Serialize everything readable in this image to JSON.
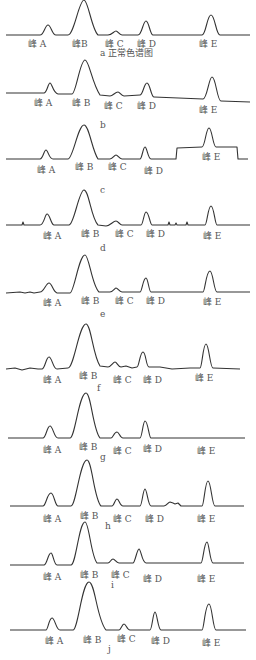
{
  "figure": {
    "panels": [
      {
        "id": "a",
        "caption": "a 正常色谱图",
        "baseline_y": 36,
        "caption_x": 100,
        "caption_y": 48,
        "labels": [
          {
            "t": "峰 A",
            "x": 28,
            "y": 39
          },
          {
            "t": "峰B",
            "x": 72,
            "y": 39
          },
          {
            "t": "峰 C",
            "x": 105,
            "y": 39
          },
          {
            "t": "峰 D",
            "x": 137,
            "y": 39
          },
          {
            "t": "峰 E",
            "x": 199,
            "y": 39
          }
        ]
      },
      {
        "id": "b",
        "caption": "b",
        "baseline_y": 94,
        "caption_x": 100,
        "caption_y": 120,
        "labels": [
          {
            "t": "峰 A",
            "x": 34,
            "y": 98
          },
          {
            "t": "峰 B",
            "x": 72,
            "y": 98
          },
          {
            "t": "峰 C",
            "x": 104,
            "y": 101
          },
          {
            "t": "峰 D",
            "x": 137,
            "y": 101
          },
          {
            "t": "峰 E",
            "x": 199,
            "y": 105
          }
        ]
      },
      {
        "id": "c",
        "caption": "c",
        "baseline_y": 159,
        "caption_x": 100,
        "caption_y": 185,
        "labels": [
          {
            "t": "峰 A",
            "x": 37,
            "y": 165
          },
          {
            "t": "峰 B",
            "x": 75,
            "y": 162
          },
          {
            "t": "峰 C",
            "x": 108,
            "y": 162
          },
          {
            "t": "峰 D",
            "x": 144,
            "y": 166
          },
          {
            "t": "峰 E",
            "x": 202,
            "y": 152
          }
        ]
      },
      {
        "id": "d",
        "caption": "d",
        "baseline_y": 225,
        "caption_x": 100,
        "caption_y": 243,
        "labels": [
          {
            "t": "峰 A",
            "x": 43,
            "y": 231
          },
          {
            "t": "峰 B",
            "x": 81,
            "y": 229
          },
          {
            "t": "峰 C",
            "x": 115,
            "y": 229
          },
          {
            "t": "峰 D",
            "x": 146,
            "y": 229
          },
          {
            "t": "峰 E",
            "x": 203,
            "y": 231
          }
        ]
      },
      {
        "id": "e",
        "caption": "e",
        "baseline_y": 292,
        "caption_x": 100,
        "caption_y": 309,
        "labels": [
          {
            "t": "峰 A",
            "x": 43,
            "y": 298
          },
          {
            "t": "峰 B",
            "x": 81,
            "y": 296
          },
          {
            "t": "峰 C",
            "x": 115,
            "y": 296
          },
          {
            "t": "峰 D",
            "x": 146,
            "y": 296
          },
          {
            "t": "峰 E",
            "x": 203,
            "y": 297
          }
        ]
      },
      {
        "id": "f",
        "caption": "f",
        "baseline_y": 368,
        "caption_x": 97,
        "caption_y": 383,
        "labels": [
          {
            "t": "峰 A",
            "x": 43,
            "y": 375
          },
          {
            "t": "峰 B",
            "x": 79,
            "y": 371
          },
          {
            "t": "峰 C",
            "x": 113,
            "y": 375
          },
          {
            "t": "峰 D",
            "x": 143,
            "y": 375
          },
          {
            "t": "峰 E",
            "x": 195,
            "y": 373
          }
        ]
      },
      {
        "id": "g",
        "caption": "g",
        "baseline_y": 438,
        "caption_x": 100,
        "caption_y": 452,
        "labels": [
          {
            "t": "峰 A",
            "x": 43,
            "y": 445
          },
          {
            "t": "峰 B",
            "x": 79,
            "y": 442
          },
          {
            "t": "峰 C",
            "x": 113,
            "y": 446
          },
          {
            "t": "峰 D",
            "x": 143,
            "y": 444
          },
          {
            "t": "峰 E",
            "x": 197,
            "y": 446
          }
        ]
      },
      {
        "id": "h",
        "caption": "h",
        "baseline_y": 506,
        "caption_x": 105,
        "caption_y": 521,
        "labels": [
          {
            "t": "峰 A",
            "x": 43,
            "y": 514
          },
          {
            "t": "峰 B",
            "x": 80,
            "y": 511
          },
          {
            "t": "峰 C",
            "x": 113,
            "y": 514
          },
          {
            "t": "峰 D",
            "x": 145,
            "y": 514
          },
          {
            "t": "峰 E",
            "x": 197,
            "y": 514
          }
        ]
      },
      {
        "id": "i",
        "caption": "i",
        "baseline_y": 565,
        "caption_x": 111,
        "caption_y": 580,
        "labels": [
          {
            "t": "峰 A",
            "x": 43,
            "y": 572
          },
          {
            "t": "峰 B",
            "x": 80,
            "y": 570
          },
          {
            "t": "峰 C",
            "x": 111,
            "y": 570
          },
          {
            "t": "峰 D",
            "x": 143,
            "y": 574
          },
          {
            "t": "峰 E",
            "x": 197,
            "y": 574
          }
        ]
      },
      {
        "id": "j",
        "caption": "j",
        "baseline_y": 631,
        "caption_x": 108,
        "caption_y": 644,
        "labels": [
          {
            "t": "峰 A",
            "x": 45,
            "y": 636
          },
          {
            "t": "峰 B",
            "x": 83,
            "y": 635
          },
          {
            "t": "峰 C",
            "x": 117,
            "y": 634
          },
          {
            "t": "峰 D",
            "x": 151,
            "y": 636
          },
          {
            "t": "峰 E",
            "x": 202,
            "y": 638
          }
        ]
      }
    ],
    "peak_names": [
      "峰 A",
      "峰 B",
      "峰 C",
      "峰 D",
      "峰 E"
    ],
    "line_color": "#333333",
    "text_color": "#555555"
  }
}
